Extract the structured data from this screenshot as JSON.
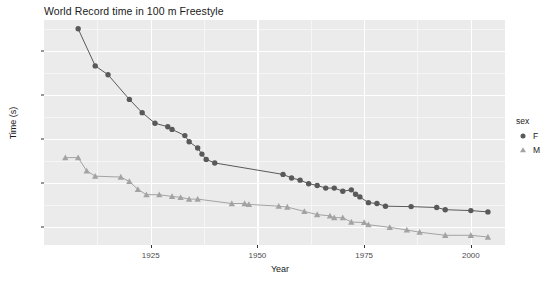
{
  "chart_data": {
    "type": "line",
    "title": "World Record time in 100 m Freestyle",
    "xlabel": "Year",
    "ylabel": "Time (s)",
    "xlim": [
      1900,
      2008
    ],
    "ylim": [
      46,
      97
    ],
    "grid": true,
    "legend_position": "right",
    "legend_title": "sex",
    "x_ticks": [
      1925,
      1950,
      1975,
      2000
    ],
    "y_ticks": [
      50,
      60,
      70,
      80,
      90
    ],
    "series": [
      {
        "name": "F",
        "label": "F",
        "marker": "circle",
        "color": "#595959",
        "points": [
          {
            "x": 1908,
            "y": 95.0
          },
          {
            "x": 1912,
            "y": 86.6
          },
          {
            "x": 1915,
            "y": 84.6
          },
          {
            "x": 1920,
            "y": 79.0
          },
          {
            "x": 1923,
            "y": 76.0
          },
          {
            "x": 1926,
            "y": 73.6
          },
          {
            "x": 1929,
            "y": 72.8
          },
          {
            "x": 1930,
            "y": 72.2
          },
          {
            "x": 1933,
            "y": 70.8
          },
          {
            "x": 1934,
            "y": 69.4
          },
          {
            "x": 1936,
            "y": 68.0
          },
          {
            "x": 1937,
            "y": 66.6
          },
          {
            "x": 1938,
            "y": 65.4
          },
          {
            "x": 1940,
            "y": 64.6
          },
          {
            "x": 1956,
            "y": 62.0
          },
          {
            "x": 1958,
            "y": 61.2
          },
          {
            "x": 1960,
            "y": 60.7
          },
          {
            "x": 1962,
            "y": 59.9
          },
          {
            "x": 1964,
            "y": 59.5
          },
          {
            "x": 1966,
            "y": 58.9
          },
          {
            "x": 1968,
            "y": 58.9
          },
          {
            "x": 1970,
            "y": 58.2
          },
          {
            "x": 1972,
            "y": 58.5
          },
          {
            "x": 1973,
            "y": 57.5
          },
          {
            "x": 1974,
            "y": 56.9
          },
          {
            "x": 1976,
            "y": 55.6
          },
          {
            "x": 1978,
            "y": 55.4
          },
          {
            "x": 1980,
            "y": 54.8
          },
          {
            "x": 1986,
            "y": 54.7
          },
          {
            "x": 1992,
            "y": 54.5
          },
          {
            "x": 1994,
            "y": 54.0
          },
          {
            "x": 2000,
            "y": 53.8
          },
          {
            "x": 2004,
            "y": 53.5
          }
        ]
      },
      {
        "name": "M",
        "label": "M",
        "marker": "triangle",
        "color": "#a3a3a3",
        "points": [
          {
            "x": 1905,
            "y": 65.8
          },
          {
            "x": 1908,
            "y": 65.8
          },
          {
            "x": 1910,
            "y": 62.8
          },
          {
            "x": 1912,
            "y": 61.6
          },
          {
            "x": 1918,
            "y": 61.4
          },
          {
            "x": 1920,
            "y": 60.4
          },
          {
            "x": 1922,
            "y": 58.6
          },
          {
            "x": 1924,
            "y": 57.4
          },
          {
            "x": 1927,
            "y": 57.4
          },
          {
            "x": 1930,
            "y": 57.0
          },
          {
            "x": 1932,
            "y": 56.8
          },
          {
            "x": 1934,
            "y": 56.4
          },
          {
            "x": 1936,
            "y": 56.4
          },
          {
            "x": 1944,
            "y": 55.4
          },
          {
            "x": 1947,
            "y": 55.4
          },
          {
            "x": 1948,
            "y": 55.2
          },
          {
            "x": 1955,
            "y": 54.8
          },
          {
            "x": 1957,
            "y": 54.6
          },
          {
            "x": 1961,
            "y": 53.6
          },
          {
            "x": 1964,
            "y": 52.9
          },
          {
            "x": 1967,
            "y": 52.6
          },
          {
            "x": 1968,
            "y": 52.2
          },
          {
            "x": 1970,
            "y": 52.2
          },
          {
            "x": 1972,
            "y": 51.2
          },
          {
            "x": 1975,
            "y": 51.1
          },
          {
            "x": 1976,
            "y": 50.6
          },
          {
            "x": 1981,
            "y": 50.0
          },
          {
            "x": 1985,
            "y": 49.4
          },
          {
            "x": 1988,
            "y": 48.9
          },
          {
            "x": 1994,
            "y": 48.2
          },
          {
            "x": 2000,
            "y": 48.2
          },
          {
            "x": 2004,
            "y": 47.8
          }
        ]
      }
    ]
  }
}
